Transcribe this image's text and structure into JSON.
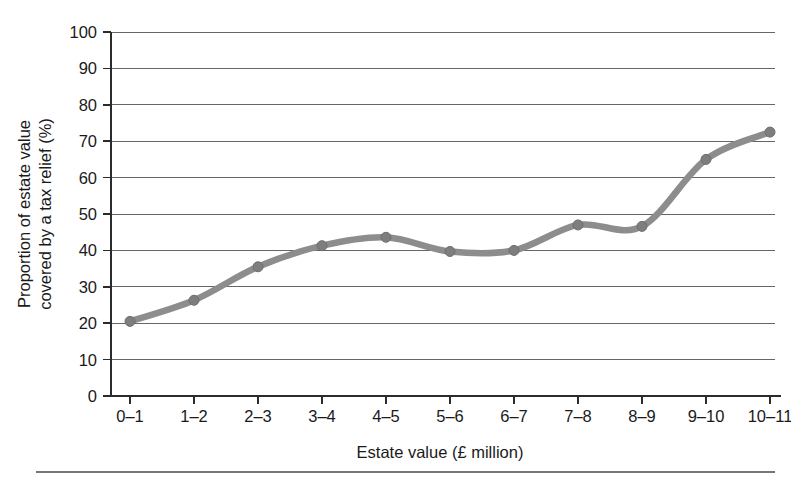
{
  "chart_data": {
    "type": "line",
    "title": "",
    "xlabel": "Estate value (£ million)",
    "ylabel": "Proportion of estate value covered by a tax relief (%)",
    "ylabel_lines": [
      "Proportion of estate value",
      "covered by a tax relief (%)"
    ],
    "categories": [
      "0–1",
      "1–2",
      "2–3",
      "3–4",
      "4–5",
      "5–6",
      "6–7",
      "7–8",
      "8–9",
      "9–10",
      "10–11"
    ],
    "values": [
      20.5,
      26.3,
      35.5,
      41.3,
      43.6,
      39.7,
      40.0,
      47.0,
      46.6,
      65.0,
      72.5
    ],
    "series": [
      {
        "name": "Proportion of estate value covered by a tax relief",
        "values": [
          20.5,
          26.3,
          35.5,
          41.3,
          43.6,
          39.7,
          40.0,
          47.0,
          46.6,
          65.0,
          72.5
        ],
        "color": "#8d8d8d",
        "marker": "circle"
      }
    ],
    "ylim": [
      0,
      100
    ],
    "yticks": [
      0,
      10,
      20,
      30,
      40,
      50,
      60,
      70,
      80,
      90,
      100
    ],
    "ytick_labels": [
      "0",
      "10",
      "20",
      "30",
      "40",
      "50",
      "60",
      "70",
      "80",
      "90",
      "100"
    ],
    "grid": true,
    "grid_axis": "y",
    "legend": false,
    "legend_position": "none",
    "smooth": true,
    "line_color": "#8d8d8d",
    "marker_color": "#7e7e7e",
    "grid_color": "#555555",
    "axis_color": "#2b2b2b",
    "background": "#ffffff"
  },
  "footer": {
    "rule_visible": true
  }
}
